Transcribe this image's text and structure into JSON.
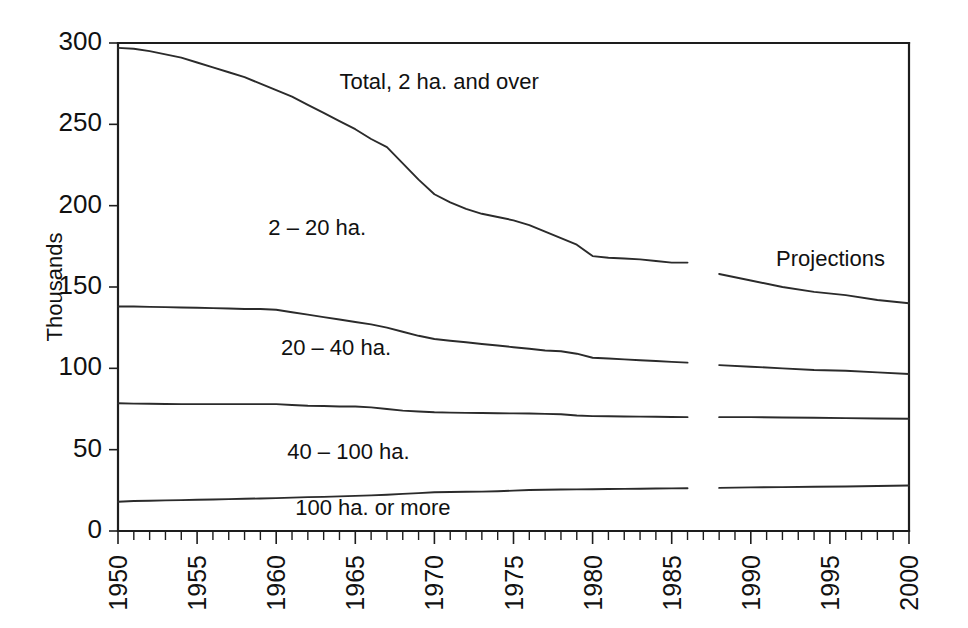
{
  "chart_data": {
    "type": "line",
    "title": "",
    "subtitle": "",
    "xlabel": "",
    "ylabel": "Thousands",
    "xlim": [
      1950,
      2000
    ],
    "ylim": [
      0,
      300
    ],
    "yticks": [
      0,
      50,
      100,
      150,
      200,
      250,
      300
    ],
    "ytick_labels": [
      "0",
      "50",
      "100",
      "150",
      "200",
      "250",
      "300"
    ],
    "xticks": [
      1950,
      1955,
      1960,
      1965,
      1970,
      1975,
      1980,
      1985,
      1990,
      1995,
      2000
    ],
    "xtick_labels": [
      "1950",
      "1955",
      "1960",
      "1965",
      "1970",
      "1975",
      "1980",
      "1985",
      "1990",
      "1995",
      "2000"
    ],
    "xtick_minor_step": 1,
    "grid": false,
    "legend_position": "inline-labels",
    "line_color": "#2b2b2b",
    "axis_color": "#1d1d1d",
    "historical_range": [
      1950,
      1986
    ],
    "projection_range": [
      1988,
      2000
    ],
    "annotations": [
      {
        "name": "projections-label",
        "text": "Projections",
        "x": 1991.6,
        "y": 163
      },
      {
        "name": "total-series-label",
        "text": "Total, 2 ha. and over",
        "x": 1964.0,
        "y": 272
      },
      {
        "name": "series-label-2-20",
        "text": "2 – 20 ha.",
        "x": 1959.5,
        "y": 182
      },
      {
        "name": "series-label-20-40",
        "text": "20 – 40 ha.",
        "x": 1960.3,
        "y": 108
      },
      {
        "name": "series-label-40-100",
        "text": "40 – 100 ha.",
        "x": 1960.7,
        "y": 44
      },
      {
        "name": "series-label-100-plus",
        "text": "100 ha. or more",
        "x": 1961.2,
        "y": 10
      }
    ],
    "series": [
      {
        "name": "Total, 2 ha. and over",
        "segment": "historical",
        "x": [
          1950,
          1951,
          1952,
          1953,
          1954,
          1955,
          1956,
          1957,
          1958,
          1959,
          1960,
          1961,
          1962,
          1963,
          1964,
          1965,
          1966,
          1967,
          1968,
          1969,
          1970,
          1971,
          1972,
          1973,
          1974,
          1975,
          1976,
          1977,
          1978,
          1979,
          1980,
          1981,
          1982,
          1983,
          1984,
          1985,
          1986
        ],
        "values": [
          297,
          296.5,
          295,
          293,
          291,
          288,
          285,
          282,
          279,
          275,
          271,
          267,
          262,
          257,
          252,
          247,
          241,
          236,
          226,
          216,
          207,
          202,
          198,
          195,
          193,
          191,
          188,
          184,
          180,
          176,
          169,
          168,
          167.5,
          167,
          166,
          165,
          165
        ]
      },
      {
        "name": "Total, 2 ha. and over",
        "segment": "projection",
        "x": [
          1988,
          1990,
          1992,
          1994,
          1996,
          1998,
          2000
        ],
        "values": [
          158,
          154,
          150,
          147,
          145,
          142,
          140
        ]
      },
      {
        "name": "2 – 20 ha.",
        "segment": "historical",
        "x": [
          1950,
          1951,
          1952,
          1953,
          1954,
          1955,
          1956,
          1957,
          1958,
          1959,
          1960,
          1961,
          1962,
          1963,
          1964,
          1965,
          1966,
          1967,
          1968,
          1969,
          1970,
          1971,
          1972,
          1973,
          1974,
          1975,
          1976,
          1977,
          1978,
          1979,
          1980,
          1981,
          1982,
          1983,
          1984,
          1985,
          1986
        ],
        "values": [
          138,
          138,
          137.8,
          137.6,
          137.4,
          137.2,
          137,
          136.8,
          136.5,
          136.5,
          136,
          134.5,
          133,
          131.5,
          130,
          128.5,
          127,
          125,
          122.5,
          120,
          118,
          117,
          116,
          115,
          114,
          113,
          112,
          111,
          110.5,
          109,
          106.5,
          106,
          105.5,
          105,
          104.5,
          104,
          103.5
        ]
      },
      {
        "name": "2 – 20 ha.",
        "segment": "projection",
        "x": [
          1988,
          1990,
          1992,
          1994,
          1996,
          1998,
          2000
        ],
        "values": [
          102,
          101,
          100,
          99,
          98.5,
          97.5,
          96.5
        ]
      },
      {
        "name": "40 – 100 ha.",
        "segment": "historical",
        "x": [
          1950,
          1951,
          1952,
          1953,
          1954,
          1955,
          1956,
          1957,
          1958,
          1959,
          1960,
          1961,
          1962,
          1963,
          1964,
          1965,
          1966,
          1967,
          1968,
          1969,
          1970,
          1971,
          1972,
          1973,
          1974,
          1975,
          1976,
          1977,
          1978,
          1979,
          1980,
          1981,
          1982,
          1983,
          1984,
          1985,
          1986
        ],
        "values": [
          78.5,
          78.3,
          78.2,
          78.1,
          78,
          78,
          78,
          78,
          78,
          78,
          78,
          77.5,
          77,
          76.8,
          76.5,
          76.5,
          76,
          75,
          74,
          73.5,
          73,
          72.8,
          72.6,
          72.5,
          72.4,
          72.3,
          72.2,
          72,
          71.8,
          71,
          70.6,
          70.5,
          70.4,
          70.3,
          70.2,
          70.1,
          70
        ]
      },
      {
        "name": "40 – 100 ha.",
        "segment": "projection",
        "x": [
          1988,
          1990,
          1992,
          1994,
          1996,
          1998,
          2000
        ],
        "values": [
          70,
          70,
          69.8,
          69.6,
          69.4,
          69.2,
          69
        ]
      },
      {
        "name": "100 ha. or more",
        "segment": "historical",
        "x": [
          1950,
          1951,
          1952,
          1953,
          1954,
          1955,
          1956,
          1957,
          1958,
          1959,
          1960,
          1961,
          1962,
          1963,
          1964,
          1965,
          1966,
          1967,
          1968,
          1969,
          1970,
          1971,
          1972,
          1973,
          1974,
          1975,
          1976,
          1977,
          1978,
          1979,
          1980,
          1981,
          1982,
          1983,
          1984,
          1985,
          1986
        ],
        "values": [
          18,
          18.4,
          18.6,
          18.8,
          19,
          19.2,
          19.4,
          19.6,
          19.8,
          20,
          20.2,
          20.5,
          20.8,
          21,
          21.3,
          21.6,
          21.9,
          22.3,
          22.8,
          23.3,
          23.8,
          24,
          24.1,
          24.2,
          24.4,
          24.8,
          25.2,
          25.4,
          25.5,
          25.6,
          25.7,
          25.8,
          25.9,
          26,
          26.1,
          26.2,
          26.3
        ]
      },
      {
        "name": "100 ha. or more",
        "segment": "projection",
        "x": [
          1988,
          1990,
          1992,
          1994,
          1996,
          1998,
          2000
        ],
        "values": [
          26.5,
          26.8,
          27,
          27.2,
          27.4,
          27.7,
          28
        ]
      }
    ]
  },
  "axes": {
    "ylabel": "Thousands"
  }
}
